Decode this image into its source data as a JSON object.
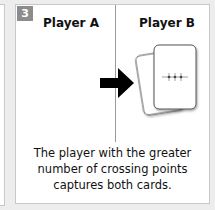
{
  "step": {
    "number": "3"
  },
  "columns": [
    {
      "label": "Player A"
    },
    {
      "label": "Player B"
    }
  ],
  "caption": {
    "lines": [
      "The player with the greater",
      "number of crossing points",
      "captures both cards."
    ]
  },
  "icons": [
    "arrow-right-icon",
    "card-stack-icon",
    "crossing-points-icon"
  ],
  "colors": {
    "badge": "#8c8c8c",
    "background": "#ededed",
    "panel": "#ffffff",
    "text": "#111111"
  }
}
